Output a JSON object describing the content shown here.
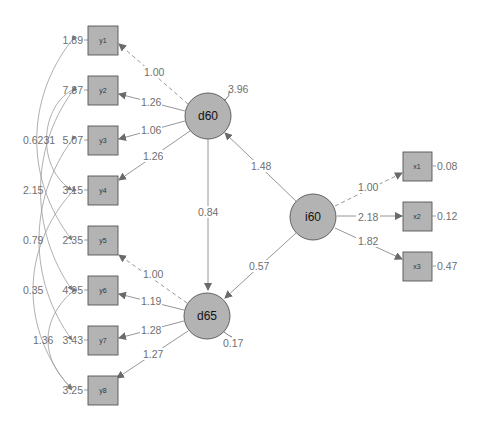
{
  "colors": {
    "node_fill": "#b3b3b3",
    "node_stroke": "#555555",
    "edge": "#8a8a8a",
    "label": "#6f6f6f"
  },
  "observed_left": [
    {
      "id": "y1",
      "residual": "1.89"
    },
    {
      "id": "y2",
      "residual": "7.37"
    },
    {
      "id": "y3",
      "residual": "5.07"
    },
    {
      "id": "y4",
      "residual": "3.15"
    },
    {
      "id": "y5",
      "residual": "2.35"
    },
    {
      "id": "y6",
      "residual": "4.95"
    },
    {
      "id": "y7",
      "residual": "3.43"
    },
    {
      "id": "y8",
      "residual": "3.25"
    }
  ],
  "observed_right": [
    {
      "id": "x1",
      "residual": "0.08"
    },
    {
      "id": "x2",
      "residual": "0.12"
    },
    {
      "id": "x3",
      "residual": "0.47"
    }
  ],
  "latents": [
    {
      "id": "d60",
      "variance": "3.96"
    },
    {
      "id": "d65",
      "variance": "0.17"
    },
    {
      "id": "i60",
      "variance": ""
    }
  ],
  "loadings": {
    "d60": [
      {
        "to": "y1",
        "value": "1.00",
        "fixed": true
      },
      {
        "to": "y2",
        "value": "1.26",
        "fixed": false
      },
      {
        "to": "y3",
        "value": "1.06",
        "fixed": false
      },
      {
        "to": "y4",
        "value": "1.26",
        "fixed": false
      }
    ],
    "d65": [
      {
        "to": "y5",
        "value": "1.00",
        "fixed": true
      },
      {
        "to": "y6",
        "value": "1.19",
        "fixed": false
      },
      {
        "to": "y7",
        "value": "1.28",
        "fixed": false
      },
      {
        "to": "y8",
        "value": "1.27",
        "fixed": false
      }
    ],
    "i60": [
      {
        "to": "x1",
        "value": "1.00",
        "fixed": true
      },
      {
        "to": "x2",
        "value": "2.18",
        "fixed": false
      },
      {
        "to": "x3",
        "value": "1.82",
        "fixed": false
      }
    ]
  },
  "regressions": [
    {
      "from": "i60",
      "to": "d60",
      "value": "1.48"
    },
    {
      "from": "i60",
      "to": "d65",
      "value": "0.57"
    },
    {
      "from": "d60",
      "to": "d65",
      "value": "0.84"
    }
  ],
  "residual_covariances": [
    {
      "between": "y1-y5",
      "value": "0.62"
    },
    {
      "between": "y2-y4",
      "value": "0.31"
    },
    {
      "between": "y2-y6",
      "value": "2.15"
    },
    {
      "between": "y3-y7",
      "value": "0.79"
    },
    {
      "between": "y4-y8",
      "value": "0.35"
    },
    {
      "between": "y6-y8",
      "value": "1.36"
    }
  ],
  "overlap_label": "0.6231"
}
